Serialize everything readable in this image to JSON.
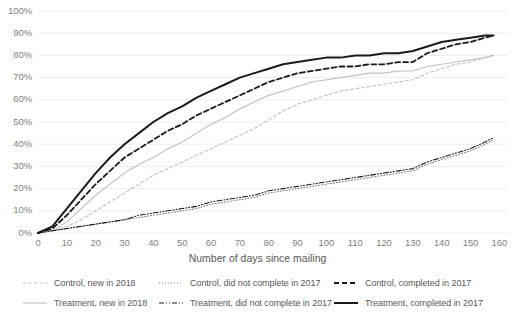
{
  "chart_data": {
    "type": "line",
    "title": "",
    "xlabel": "Number of days since mailing",
    "ylabel": "",
    "xlim": [
      0,
      163
    ],
    "ylim": [
      0,
      1.0
    ],
    "grid": true,
    "legend_position": "bottom",
    "x_ticks": [
      "0",
      "10",
      "20",
      "30",
      "40",
      "50",
      "60",
      "70",
      "80",
      "90",
      "100",
      "110",
      "120",
      "130",
      "140",
      "150",
      "160"
    ],
    "y_ticks": [
      "0%",
      "10%",
      "20%",
      "30%",
      "40%",
      "50%",
      "60%",
      "70%",
      "80%",
      "90%",
      "100%"
    ],
    "x": [
      0,
      5,
      10,
      15,
      20,
      25,
      30,
      35,
      40,
      45,
      50,
      55,
      60,
      65,
      70,
      75,
      80,
      85,
      90,
      95,
      100,
      105,
      110,
      115,
      120,
      125,
      130,
      135,
      140,
      145,
      150,
      155,
      158
    ],
    "series": [
      {
        "name": "Control, new in 2018",
        "key": "control_new_2018",
        "color": "#bfbfbf",
        "style": "dashed",
        "width": 1.1,
        "values": [
          0,
          1,
          3,
          6,
          10,
          14,
          18,
          22,
          26,
          29,
          32,
          35,
          38,
          41,
          44,
          47,
          51,
          55,
          58,
          60,
          62,
          64,
          65,
          66,
          67,
          68,
          69,
          72,
          74,
          76,
          77,
          79,
          80
        ]
      },
      {
        "name": "Control, did not complete in 2017",
        "key": "control_did_not_complete_2017",
        "color": "#808080",
        "style": "dotted",
        "width": 1.1,
        "values": [
          0,
          1,
          2,
          3,
          4,
          5,
          6,
          7,
          8,
          9,
          10,
          11,
          13,
          14,
          15,
          16,
          18,
          19,
          20,
          21,
          22,
          23,
          24,
          25,
          26,
          27,
          28,
          31,
          33,
          35,
          37,
          40,
          42
        ]
      },
      {
        "name": "Control, completed in 2017",
        "key": "control_completed_2017",
        "color": "#1a1a1a",
        "style": "dashed",
        "width": 1.8,
        "values": [
          0,
          2,
          8,
          15,
          22,
          28,
          34,
          38,
          42,
          46,
          49,
          53,
          56,
          59,
          62,
          65,
          68,
          70,
          72,
          73,
          74,
          75,
          75,
          76,
          76,
          77,
          77,
          81,
          83,
          85,
          86,
          88,
          89
        ]
      },
      {
        "name": "Treatment, new in 2018",
        "key": "treatment_new_2018",
        "color": "#bfbfbf",
        "style": "solid",
        "width": 1.1,
        "values": [
          0,
          1,
          5,
          11,
          17,
          22,
          27,
          31,
          34,
          38,
          41,
          45,
          49,
          52,
          56,
          59,
          62,
          64,
          66,
          68,
          69,
          70,
          71,
          72,
          72,
          73,
          73,
          75,
          76,
          77,
          78,
          79,
          80
        ]
      },
      {
        "name": "Treatment, did not complete in 2017",
        "key": "treatment_did_not_complete_2017",
        "color": "#1a1a1a",
        "style": "dashdotdot",
        "width": 1.1,
        "values": [
          0,
          1,
          2,
          3,
          4,
          5,
          6,
          8,
          9,
          10,
          11,
          12,
          14,
          15,
          16,
          17,
          19,
          20,
          21,
          22,
          23,
          24,
          25,
          26,
          27,
          28,
          29,
          32,
          34,
          36,
          38,
          41,
          43
        ]
      },
      {
        "name": "Treatment, completed in 2017",
        "key": "treatment_completed_2017",
        "color": "#1a1a1a",
        "style": "solid",
        "width": 2.0,
        "values": [
          0,
          3,
          11,
          19,
          27,
          34,
          40,
          45,
          50,
          54,
          57,
          61,
          64,
          67,
          70,
          72,
          74,
          76,
          77,
          78,
          79,
          79,
          80,
          80,
          81,
          81,
          82,
          84,
          86,
          87,
          88,
          89,
          89
        ]
      }
    ]
  },
  "axis": {
    "x_title": "Number of days since mailing"
  },
  "legend": {
    "items": [
      {
        "label": "Control, new in 2018",
        "key": "control_new_2018"
      },
      {
        "label": "Control, did not complete in 2017",
        "key": "control_did_not_complete_2017"
      },
      {
        "label": "Control, completed in 2017",
        "key": "control_completed_2017"
      },
      {
        "label": "Treatment, new in 2018",
        "key": "treatment_new_2018"
      },
      {
        "label": "Treatment, did not complete in 2017",
        "key": "treatment_did_not_complete_2017"
      },
      {
        "label": "Treatment, completed in 2017",
        "key": "treatment_completed_2017"
      }
    ]
  },
  "colors": {
    "grid": "#ededed",
    "tick_text": "#7f7f7f",
    "axis_text": "#595959",
    "light_series": "#bfbfbf",
    "mid_series": "#808080",
    "dark_series": "#1a1a1a",
    "background": "#ffffff"
  }
}
